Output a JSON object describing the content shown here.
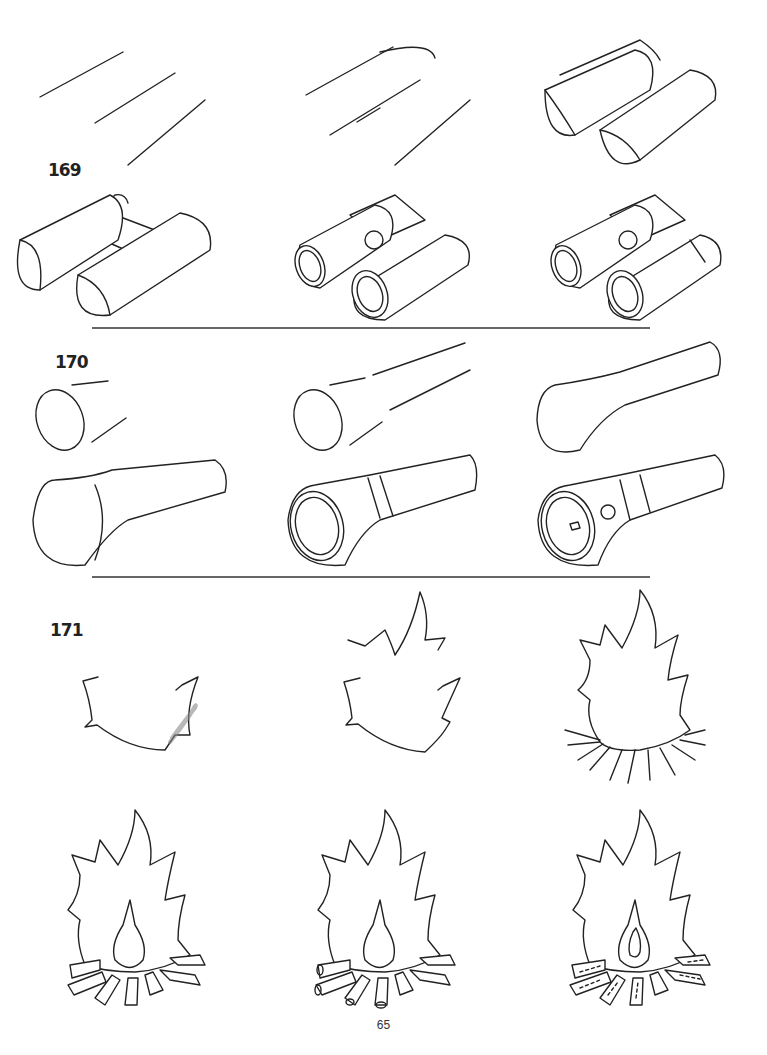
{
  "page": {
    "page_number": "65",
    "sections": [
      {
        "id": "169",
        "label": "169",
        "subject": "binoculars",
        "steps": 6
      },
      {
        "id": "170",
        "label": "170",
        "subject": "flashlight",
        "steps": 6
      },
      {
        "id": "171",
        "label": "171",
        "subject": "campfire",
        "steps": 6
      }
    ],
    "colors": {
      "ink": "#222222",
      "paper": "#ffffff"
    }
  }
}
